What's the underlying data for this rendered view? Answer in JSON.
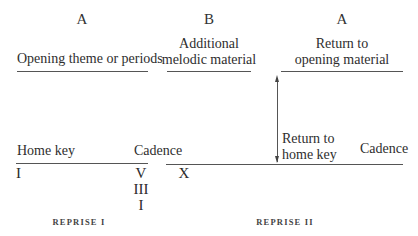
{
  "sections": [
    {
      "letter": "A",
      "description": "Opening theme or periods"
    },
    {
      "letter": "B",
      "description_line1": "Additional",
      "description_line2": "melodic material"
    },
    {
      "letter": "A",
      "description_line1": "Return to",
      "description_line2": "opening material"
    }
  ],
  "lower_labels": {
    "home_key": "Home key",
    "cadence_1": "Cadence",
    "return_line1": "Return to",
    "return_line2": "home key",
    "cadence_2": "Cadence"
  },
  "harmony": {
    "start": "I",
    "cadence_options": [
      "V",
      "III",
      "I"
    ],
    "b_start": "X"
  },
  "reprises": [
    "REPRISE I",
    "REPRISE II"
  ]
}
